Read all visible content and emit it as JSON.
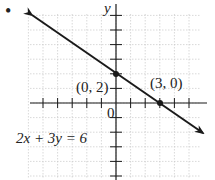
{
  "chart_data": {
    "type": "line",
    "title": "",
    "equation_label": "2x + 3y = 6",
    "xlabel": "",
    "ylabel": "y",
    "origin_label": "0",
    "xlim": [
      -6,
      6
    ],
    "ylim": [
      -5,
      6
    ],
    "grid": true,
    "series": [
      {
        "name": "2x + 3y = 6",
        "x": [
          -5.8,
          6
        ],
        "y": [
          5.87,
          -2
        ]
      }
    ],
    "points": [
      {
        "x": 0,
        "y": 2,
        "label": "(0, 2)"
      },
      {
        "x": 3,
        "y": 0,
        "label": "(3, 0)"
      }
    ],
    "colors": {
      "line": "#1a1a1a",
      "axis": "#1a1a1a",
      "grid": "#c8c8c8"
    }
  },
  "labels": {
    "y_axis": "y",
    "origin": "0",
    "point_a": "(0, 2)",
    "point_b": "(3, 0)",
    "equation": "2x + 3y = 6",
    "bullet": "•"
  }
}
